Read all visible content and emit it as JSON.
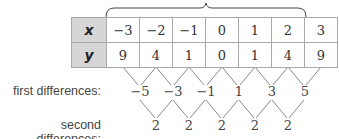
{
  "table": {
    "row_headers": [
      "x",
      "y"
    ],
    "x_values": [
      "−3",
      "−2",
      "−1",
      "0",
      "1",
      "2",
      "3"
    ],
    "y_values": [
      "9",
      "4",
      "1",
      "0",
      "1",
      "4",
      "9"
    ]
  },
  "differences": {
    "first_label": "first differences:",
    "first_values": [
      "−5",
      "−3",
      "−1",
      "1",
      "3",
      "5"
    ],
    "second_label": "second differences:",
    "second_values": [
      "2",
      "2",
      "2",
      "2",
      "2"
    ]
  },
  "colors": {
    "header_fill": "#d6d6d6",
    "border": "#a8a8a8",
    "line": "#888888"
  }
}
